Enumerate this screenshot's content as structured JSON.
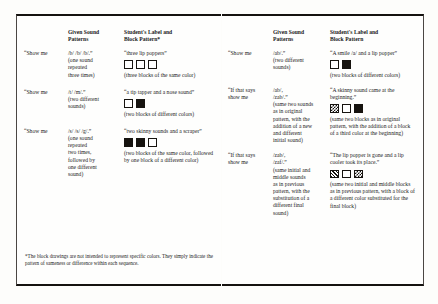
{
  "document": {
    "type": "book-spread",
    "ink_color": "#16130f",
    "paper_color": "#fefefd"
  },
  "left_page": {
    "headers": {
      "prompt": "",
      "given": "Given Sound Patterns",
      "given_line1": "Given Sound",
      "given_line2": "Patterns",
      "student": "Student's Label and Block Pattern*",
      "student_line1": "Student's Label and",
      "student_line2": "Block Pattern*"
    },
    "rows": [
      {
        "prompt": "“Show me",
        "given_sound": "/b/  /b/  /b/.”",
        "given_note_l1": "(one sound",
        "given_note_l2": "repeated",
        "given_note_l3": "three times)",
        "student_quote": "“three lip poppers”",
        "blocks": [
          "open",
          "open",
          "open"
        ],
        "student_note": "(three blocks of the same color)"
      },
      {
        "prompt": "“Show me",
        "given_sound": "/t/  /m/.”",
        "given_note_l1": "(two different",
        "given_note_l2": "sounds)",
        "given_note_l3": "",
        "student_quote": "“a tip tapper and a nose sound”",
        "blocks": [
          "open",
          "solid"
        ],
        "student_note": "(two blocks of different colors)"
      },
      {
        "prompt": "“Show me",
        "given_sound": "/s/  /s/  /g/.”",
        "given_note_l1": "(one sound",
        "given_note_l2": "repeated",
        "given_note_l3": "two times,",
        "given_note_l4": "followed by",
        "given_note_l5": "one different",
        "given_note_l6": "sound)",
        "student_quote": "“two skinny sounds and a scraper”",
        "blocks": [
          "solid",
          "solid",
          "open"
        ],
        "student_note": "(two blocks of the same color, followed by one block of a different color)"
      }
    ],
    "footnote": "*The block drawings are not intended to represent specific colors. They simply indicate the pattern of sameness or difference within each sequence."
  },
  "right_page": {
    "headers": {
      "prompt": "",
      "given_line1": "Given Sound",
      "given_line2": "Patterns",
      "student_line1": "Student's Label and",
      "student_line2": "Block Pattern"
    },
    "rows": [
      {
        "prompt": "“Show me",
        "given_sound": "/ab/.”",
        "given_note_l1": "(two different",
        "given_note_l2": "sounds)",
        "student_quote": "“A smile /a/ and a lip popper”",
        "blocks": [
          "open",
          "solid"
        ],
        "student_note": "(two blocks of different colors)"
      },
      {
        "prompt_l1": "“If that says",
        "prompt_l2": "show me",
        "given_sound_l1": "/ab/,",
        "given_sound_l2": "/zab/.”",
        "given_note_l1": "(same two sounds",
        "given_note_l2": "as in original",
        "given_note_l3": "pattern, with the",
        "given_note_l4": "addition of a new",
        "given_note_l5": "and different",
        "given_note_l6": "initial sound)",
        "student_quote": "“A skinny sound came at the beginning.”",
        "blocks": [
          "checker",
          "open",
          "solid"
        ],
        "student_note": "(same two blocks as in original pattern, with the addition of a block of a third color at the beginning)"
      },
      {
        "prompt_l1": "“If that says",
        "prompt_l2": "show me",
        "given_sound_l1": "/zab/,",
        "given_sound_l2": "/zaf/.”",
        "given_note_l1": "(same initial and",
        "given_note_l2": "middle sounds",
        "given_note_l3": "as in previous",
        "given_note_l4": "pattern, with the",
        "given_note_l5": "substitution of a",
        "given_note_l6": "different final",
        "given_note_l7": "sound)",
        "student_quote": "“The lip popper is gone and a lip cooler took its place.”",
        "blocks": [
          "hatch",
          "open",
          "checker"
        ],
        "student_note": "(same two initial and middle blocks as in previous pattern, with a block of a different color substituted for the final block)"
      }
    ]
  }
}
